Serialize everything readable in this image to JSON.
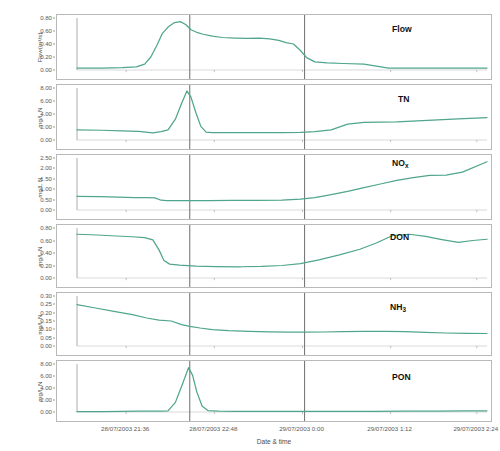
{
  "chart_data": {
    "type": "line",
    "title": "",
    "xlabel": "Date & time",
    "grid": true,
    "legend": "none",
    "line_color": "#4fa58d",
    "reference_line_color": "#7a7a7a",
    "x_tick_labels": [
      "28/07/2003 21:36",
      "28/07/2003 22:48",
      "29/07/2003 0:00",
      "29/07/2003 1:12",
      "29/07/2003 2:24"
    ],
    "x_tick_positions": [
      0.12,
      0.335,
      0.55,
      0.765,
      0.975
    ],
    "reference_lines": [
      0.275,
      0.555
    ],
    "panels": [
      {
        "name": "Flow",
        "label": "Flow",
        "label_sub": "",
        "ylabel": "Flow(m3/s)",
        "ylabel_display": "Flow(m³/s)",
        "ylim": [
          0.0,
          0.8
        ],
        "yticks": [
          0.0,
          0.2,
          0.4,
          0.6,
          0.8
        ],
        "ytick_labels": [
          "0.00",
          "0.20",
          "0.40",
          "0.60",
          "0.80"
        ],
        "x": [
          0.0,
          0.06,
          0.11,
          0.145,
          0.165,
          0.18,
          0.195,
          0.208,
          0.222,
          0.238,
          0.252,
          0.265,
          0.278,
          0.292,
          0.308,
          0.33,
          0.355,
          0.385,
          0.415,
          0.445,
          0.47,
          0.492,
          0.51,
          0.528,
          0.545,
          0.56,
          0.58,
          0.61,
          0.65,
          0.7,
          0.76,
          0.82,
          0.88,
          0.94,
          1.0
        ],
        "y": [
          0.03,
          0.03,
          0.035,
          0.048,
          0.09,
          0.2,
          0.38,
          0.56,
          0.66,
          0.73,
          0.745,
          0.7,
          0.62,
          0.58,
          0.55,
          0.52,
          0.5,
          0.492,
          0.488,
          0.49,
          0.48,
          0.455,
          0.42,
          0.4,
          0.3,
          0.19,
          0.125,
          0.11,
          0.1,
          0.09,
          0.03,
          0.03,
          0.03,
          0.03,
          0.03
        ]
      },
      {
        "name": "TN",
        "label": "TN",
        "label_sub": "",
        "ylabel": "mg/L N",
        "ylabel_display": "mg/L N",
        "ylim": [
          0.0,
          8.0
        ],
        "yticks": [
          0.0,
          2.0,
          4.0,
          6.0,
          8.0
        ],
        "ytick_labels": [
          "0.00",
          "2.00",
          "4.00",
          "6.00",
          "8.00"
        ],
        "x": [
          0.0,
          0.06,
          0.11,
          0.15,
          0.185,
          0.205,
          0.222,
          0.24,
          0.255,
          0.268,
          0.278,
          0.29,
          0.302,
          0.315,
          0.33,
          0.36,
          0.4,
          0.45,
          0.5,
          0.545,
          0.58,
          0.62,
          0.66,
          0.7,
          0.74,
          0.78,
          0.83,
          0.88,
          0.93,
          1.0
        ],
        "y": [
          1.55,
          1.5,
          1.42,
          1.32,
          1.1,
          1.3,
          1.55,
          3.2,
          5.6,
          7.55,
          6.6,
          4.2,
          2.1,
          1.22,
          1.15,
          1.13,
          1.12,
          1.12,
          1.13,
          1.18,
          1.3,
          1.55,
          2.45,
          2.7,
          2.75,
          2.8,
          2.95,
          3.1,
          3.25,
          3.45
        ]
      },
      {
        "name": "NOx",
        "label": "NO",
        "label_sub": "x",
        "ylabel": "mg/L N",
        "ylabel_display": "mg/L N",
        "ylim": [
          0.0,
          2.5
        ],
        "yticks": [
          0.0,
          0.5,
          1.0,
          1.5,
          2.0,
          2.5
        ],
        "ytick_labels": [
          "0.00",
          "0.50",
          "1.00",
          "1.50",
          "2.00",
          "2.50"
        ],
        "x": [
          0.0,
          0.055,
          0.1,
          0.14,
          0.17,
          0.19,
          0.205,
          0.218,
          0.235,
          0.27,
          0.32,
          0.38,
          0.44,
          0.5,
          0.545,
          0.58,
          0.62,
          0.66,
          0.7,
          0.74,
          0.78,
          0.82,
          0.86,
          0.9,
          0.94,
          1.0
        ],
        "y": [
          0.66,
          0.64,
          0.615,
          0.6,
          0.59,
          0.58,
          0.47,
          0.455,
          0.45,
          0.45,
          0.455,
          0.46,
          0.465,
          0.48,
          0.52,
          0.6,
          0.74,
          0.9,
          1.08,
          1.25,
          1.42,
          1.56,
          1.66,
          1.68,
          1.82,
          2.32
        ]
      },
      {
        "name": "DON",
        "label": "DON",
        "label_sub": "",
        "ylabel": "mg/L N",
        "ylabel_display": "mg/L N",
        "ylim": [
          0.0,
          0.8
        ],
        "yticks": [
          0.0,
          0.2,
          0.4,
          0.6,
          0.8
        ],
        "ytick_labels": [
          "0.00",
          "0.20",
          "0.40",
          "0.60",
          "0.80"
        ],
        "x": [
          0.0,
          0.05,
          0.095,
          0.135,
          0.165,
          0.185,
          0.2,
          0.212,
          0.226,
          0.25,
          0.29,
          0.34,
          0.4,
          0.45,
          0.5,
          0.545,
          0.59,
          0.64,
          0.69,
          0.73,
          0.77,
          0.81,
          0.85,
          0.89,
          0.93,
          0.965,
          1.0
        ],
        "y": [
          0.7,
          0.688,
          0.672,
          0.66,
          0.645,
          0.61,
          0.45,
          0.28,
          0.222,
          0.205,
          0.19,
          0.182,
          0.18,
          0.186,
          0.2,
          0.23,
          0.29,
          0.37,
          0.46,
          0.56,
          0.68,
          0.7,
          0.665,
          0.615,
          0.57,
          0.6,
          0.62
        ]
      },
      {
        "name": "NH3",
        "label": "NH",
        "label_sub": "3",
        "ylabel": "mg/L N",
        "ylabel_display": "mg/L N",
        "ylim": [
          0.0,
          0.3
        ],
        "yticks": [
          0.0,
          0.05,
          0.1,
          0.15,
          0.2,
          0.25,
          0.3
        ],
        "ytick_labels": [
          "0.00",
          "0.05",
          "0.10",
          "0.15",
          "0.20",
          "0.25",
          "0.30"
        ],
        "x": [
          0.0,
          0.045,
          0.09,
          0.135,
          0.17,
          0.2,
          0.23,
          0.255,
          0.275,
          0.3,
          0.33,
          0.37,
          0.42,
          0.47,
          0.52,
          0.555,
          0.6,
          0.65,
          0.7,
          0.75,
          0.8,
          0.85,
          0.9,
          0.95,
          1.0
        ],
        "y": [
          0.248,
          0.228,
          0.208,
          0.188,
          0.168,
          0.155,
          0.15,
          0.128,
          0.118,
          0.108,
          0.098,
          0.092,
          0.088,
          0.085,
          0.083,
          0.083,
          0.084,
          0.086,
          0.088,
          0.088,
          0.086,
          0.082,
          0.078,
          0.076,
          0.075
        ]
      },
      {
        "name": "PON",
        "label": "PON",
        "label_sub": "",
        "ylabel": "mg/L N",
        "ylabel_display": "mg/L N",
        "ylim": [
          0.0,
          8.0
        ],
        "yticks": [
          0.0,
          2.0,
          4.0,
          6.0,
          8.0
        ],
        "ytick_labels": [
          "0.00",
          "2.00",
          "4.00",
          "6.00",
          "8.00"
        ],
        "x": [
          0.0,
          0.06,
          0.11,
          0.15,
          0.185,
          0.205,
          0.222,
          0.24,
          0.258,
          0.272,
          0.282,
          0.292,
          0.305,
          0.32,
          0.345,
          0.39,
          0.45,
          0.52,
          0.58,
          0.65,
          0.72,
          0.8,
          0.88,
          0.94,
          1.0
        ],
        "y": [
          0.05,
          0.07,
          0.12,
          0.15,
          0.14,
          0.13,
          0.18,
          1.6,
          4.8,
          7.4,
          6.1,
          3.4,
          1.0,
          0.22,
          0.15,
          0.12,
          0.1,
          0.1,
          0.1,
          0.1,
          0.12,
          0.14,
          0.16,
          0.18,
          0.2
        ]
      }
    ]
  }
}
